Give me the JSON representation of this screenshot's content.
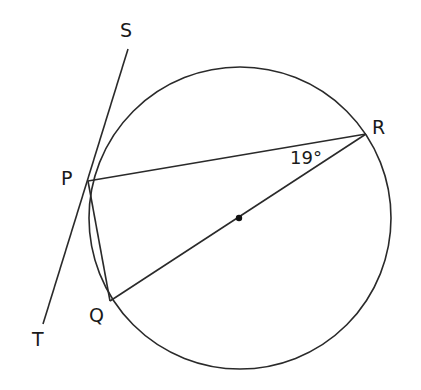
{
  "diagram": {
    "type": "circle-geometry",
    "circle": {
      "center": [
        240,
        218
      ],
      "radius": 152,
      "center_marked": true
    },
    "points": {
      "P": {
        "label": "P",
        "pos": [
          88,
          181
        ]
      },
      "Q": {
        "label": "Q",
        "pos": [
          110,
          301
        ]
      },
      "R": {
        "label": "R",
        "pos": [
          366,
          134
        ]
      },
      "S": {
        "label": "S",
        "pos": [
          128,
          49
        ]
      },
      "T": {
        "label": "T",
        "pos": [
          43,
          324
        ]
      }
    },
    "segments": [
      {
        "from": "S",
        "to": "T",
        "note": "tangent at P"
      },
      {
        "from": "P",
        "to": "R"
      },
      {
        "from": "P",
        "to": "Q"
      },
      {
        "from": "Q",
        "to": "R",
        "note": "diameter through center"
      }
    ],
    "angle_label": {
      "text": "19°",
      "at_vertex": "R",
      "between": [
        "P",
        "Q"
      ]
    }
  }
}
